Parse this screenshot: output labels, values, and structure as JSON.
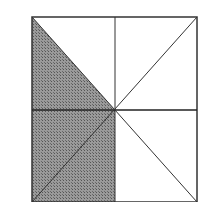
{
  "figure": {
    "colors": {
      "background": "#ffffff",
      "stroke": "#333333",
      "shade": "#8a8a8a"
    },
    "square": {
      "x1": 32,
      "y1": 17,
      "x2": 197,
      "y2": 202
    },
    "center": {
      "x": 115,
      "y": 110
    }
  }
}
